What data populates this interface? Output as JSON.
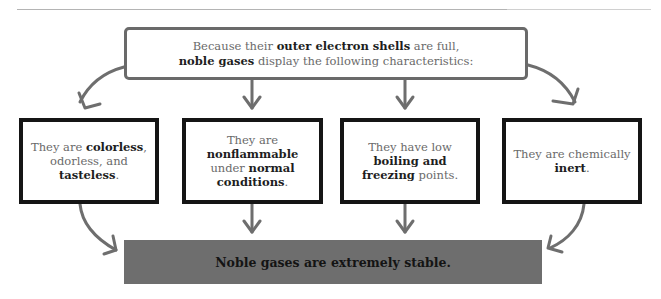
{
  "diagram": {
    "title_box": {
      "line1_prefix": "Because their ",
      "line1_bold": "outer electron shells",
      "line1_suffix": " are full,",
      "line2_bold": "noble gases",
      "line2_suffix": " display the following characteristics:"
    },
    "characteristics": [
      {
        "parts": [
          {
            "text": "They are ",
            "bold": false
          },
          {
            "text": "colorless",
            "bold": true
          },
          {
            "text": ", odorless, and ",
            "bold": false
          },
          {
            "text": "tasteless",
            "bold": true
          },
          {
            "text": ".",
            "bold": false
          }
        ]
      },
      {
        "parts": [
          {
            "text": "They are ",
            "bold": false
          },
          {
            "text": "nonflammable",
            "bold": true
          },
          {
            "text": " under ",
            "bold": false
          },
          {
            "text": "normal conditions",
            "bold": true
          },
          {
            "text": ".",
            "bold": false
          }
        ]
      },
      {
        "parts": [
          {
            "text": "They have low ",
            "bold": false
          },
          {
            "text": "boiling and freezing",
            "bold": true
          },
          {
            "text": " points.",
            "bold": false
          }
        ]
      },
      {
        "parts": [
          {
            "text": "They are chemically ",
            "bold": false
          },
          {
            "text": "inert",
            "bold": true
          },
          {
            "text": ".",
            "bold": false
          }
        ]
      }
    ],
    "conclusion": "Noble gases are extremely stable.",
    "colors": {
      "arrow": "#6e6e6e",
      "box_border": "#151515",
      "conclusion_fill": "#6e6e6e",
      "text_light": "#6a6a6a",
      "text_bold": "#1e1e1e"
    }
  }
}
